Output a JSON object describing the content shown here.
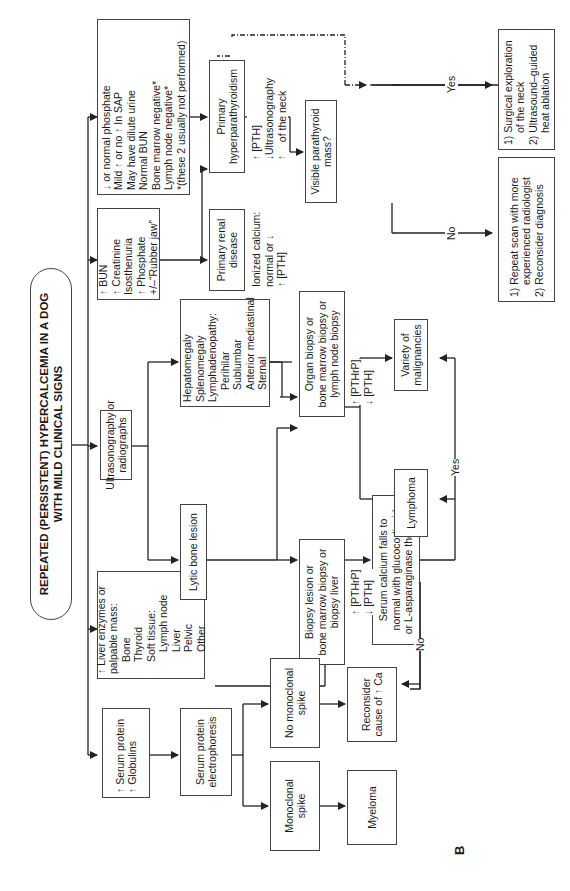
{
  "figure_label": "B",
  "title": {
    "line1": "REPEATED (PERSISTENT) HYPERCALCEMIA IN A DOG",
    "line2": "WITH MILD CLINICAL SIGNS"
  },
  "nodes": {
    "hyperpara_findings": {
      "lines": [
        {
          "arrow": "down",
          "text": " or normal phosphate"
        },
        {
          "arrow": "",
          "text": "Mild ↑ or no ↑ In SAP"
        },
        {
          "arrow": "",
          "text": "May have dilute urine"
        },
        {
          "arrow": "",
          "text": "Normal BUN"
        },
        {
          "arrow": "",
          "text": "Bone marrow negative*"
        },
        {
          "arrow": "",
          "text": "Lymph node negative*"
        },
        {
          "arrow": "",
          "text": "*(these 2 usually not performed)"
        }
      ]
    },
    "renal_findings": {
      "lines": [
        {
          "arrow": "up",
          "text": " BUN"
        },
        {
          "arrow": "up",
          "text": " Creatinine"
        },
        {
          "arrow": "",
          "text": "Isosthenuria"
        },
        {
          "arrow": "up",
          "text": " Phosphate"
        },
        {
          "arrow": "",
          "text": "+/–“Rubber jaw”"
        }
      ]
    },
    "imaging": {
      "lines": [
        "Ultrasonography or",
        "radiographs"
      ]
    },
    "organomegaly": {
      "lines": [
        "Hepatomegaly",
        "Splenomegaly",
        "Lymphadenopathy:",
        "Perihilar",
        "Sublumbar",
        "Anterior mediastinal",
        "Sternal"
      ]
    },
    "lytic_bone": {
      "lines": [
        "Lytic bone lesion"
      ]
    },
    "liver_mass": {
      "lines": [
        "↑ Liver enzymes or",
        "palpable mass:",
        "Bone",
        "Thyroid",
        "Soft tissue:",
        "Lymph node",
        "Liver",
        "Pelvic",
        "Other"
      ]
    },
    "serum_protein": {
      "lines": [
        "↑ Serum protein",
        "↑ Globulins"
      ]
    },
    "electrophoresis": {
      "lines": [
        "Serum protein",
        "electrophoresis"
      ]
    },
    "monoclonal": {
      "lines": [
        "Monoclonal",
        "spike"
      ]
    },
    "no_monoclonal": {
      "lines": [
        "No monoclonal",
        "spike"
      ]
    },
    "myeloma": {
      "lines": [
        "Myeloma"
      ]
    },
    "reconsider_ca": {
      "lines": [
        "Reconsider",
        "cause of ↑ Ca"
      ]
    },
    "primary_hyperpara": {
      "lines": [
        "Primary",
        "hyperparathyroidism"
      ]
    },
    "primary_renal": {
      "lines": [
        "Primary renal",
        "disease"
      ]
    },
    "organ_biopsy": {
      "lines": [
        "Organ biopsy or",
        "bone marrow biopsy or",
        "lymph node biopsy"
      ]
    },
    "biopsy_lesion": {
      "lines": [
        "Biopsy lesion or",
        "bone marrow biopsy or",
        "biopsy liver"
      ]
    },
    "serum_calcium_falls": {
      "lines": [
        "Serum calcium falls to",
        "normal with glucocorticoid",
        "or L-asparaginase therapy?"
      ]
    },
    "visible_mass": {
      "lines": [
        "Visible parathyroid",
        "mass?"
      ]
    },
    "surgical": {
      "lines": [
        "1) Surgical exploration",
        "of the neck",
        "2) Ultrasound–guided",
        "heat ablation"
      ]
    },
    "repeat_scan": {
      "lines": [
        "1) Repeat scan with more",
        "experienced radiologist",
        "2) Reconsider diagnosis"
      ]
    },
    "variety": {
      "lines": [
        "Variety of",
        "malignancies"
      ]
    },
    "lymphoma": {
      "lines": [
        "Lymphoma"
      ]
    }
  },
  "edge_labels": {
    "hyperpara_labs": [
      "↑ [PTH]",
      "↓ [PTHrP]",
      "↑ Ionized calcium"
    ],
    "renal_labs": [
      "Ionized calcium:",
      "normal or ↓",
      "↑ [PTH]"
    ],
    "neck_us": [
      "Ultrasonography",
      "of the neck"
    ],
    "organ_labs": [
      "↑ [PTHrP]",
      "↓ [PTH]"
    ],
    "biopsy_labs": [
      "↑ [PTHrP]",
      "↓ [PTH]"
    ],
    "yes_top": "Yes",
    "no_top": "No",
    "yes_bottom": "Yes",
    "no_bottom": "No"
  }
}
